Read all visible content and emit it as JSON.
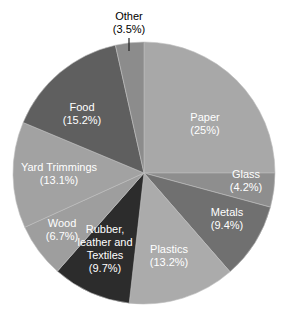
{
  "chart_data": {
    "type": "pie",
    "title": "",
    "start_angle_deg": 0,
    "direction": "clockwise",
    "center": [
      144,
      173
    ],
    "radius": 131,
    "slices": [
      {
        "name": "Paper",
        "value": 25,
        "label_lines": [
          "Paper",
          "(25%)"
        ],
        "color": "#a8a8a8",
        "text_color": "#ffffff",
        "label_pos": [
          205,
          123
        ]
      },
      {
        "name": "Glass",
        "value": 4.2,
        "label_lines": [
          "Glass",
          "(4.2%)"
        ],
        "color": "#8e8e8e",
        "text_color": "#ffffff",
        "label_pos": [
          246,
          180
        ]
      },
      {
        "name": "Metals",
        "value": 9.4,
        "label_lines": [
          "Metals",
          "(9.4%)"
        ],
        "color": "#707070",
        "text_color": "#ffffff",
        "label_pos": [
          227,
          218
        ]
      },
      {
        "name": "Plastics",
        "value": 13.2,
        "label_lines": [
          "Plastics",
          "(13.2%)"
        ],
        "color": "#ababab",
        "text_color": "#ffffff",
        "label_pos": [
          169,
          255
        ]
      },
      {
        "name": "Rubber, leather and Textiles",
        "value": 9.7,
        "label_lines": [
          "Rubber,",
          "leather and",
          "Textiles",
          "(9.7%)"
        ],
        "color": "#2c2c2c",
        "text_color": "#ffffff",
        "label_pos": [
          105,
          248
        ]
      },
      {
        "name": "Wood",
        "value": 6.7,
        "label_lines": [
          "Wood",
          "(6.7%)"
        ],
        "color": "#9e9e9e",
        "text_color": "#ffffff",
        "label_pos": [
          62,
          229
        ]
      },
      {
        "name": "Yard Trimmings",
        "value": 13.1,
        "label_lines": [
          "Yard Trimmings",
          "(13.1%)"
        ],
        "color": "#a2a2a2",
        "text_color": "#ffffff",
        "label_pos": [
          59,
          173
        ]
      },
      {
        "name": "Food",
        "value": 15.2,
        "label_lines": [
          "Food",
          "(15.2%)"
        ],
        "color": "#5f5f5f",
        "text_color": "#ffffff",
        "label_pos": [
          82,
          113
        ]
      },
      {
        "name": "Other",
        "value": 3.5,
        "label_lines": [
          "Other",
          "(3.5%)"
        ],
        "color": "#8c8c8c",
        "text_color": "#000000",
        "label_pos": [
          129,
          22
        ],
        "leader_line": [
          [
            129,
            38
          ],
          [
            129,
            51
          ]
        ]
      }
    ],
    "legend": "none",
    "background": "#ffffff"
  }
}
